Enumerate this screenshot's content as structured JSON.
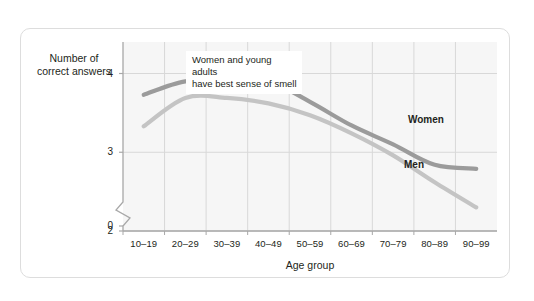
{
  "chart_data": {
    "type": "line",
    "title": "",
    "xlabel": "Age group",
    "ylabel": "Number of\ncorrect answers",
    "categories": [
      "10–19",
      "20–29",
      "30–39",
      "40–49",
      "50–59",
      "60–69",
      "70–79",
      "80–89",
      "90–99"
    ],
    "ylim": [
      2,
      4.4
    ],
    "yticks": [
      0,
      2,
      3,
      4
    ],
    "ytick_labels": [
      "0",
      "2",
      "3",
      "4"
    ],
    "y_axis_break": true,
    "grid": true,
    "legend_position": "inline",
    "series": [
      {
        "name": "Women",
        "color": "#9b9b9b",
        "values": [
          3.73,
          3.9,
          3.89,
          3.9,
          3.64,
          3.34,
          3.1,
          2.84,
          2.79
        ]
      },
      {
        "name": "Men",
        "color": "#c4c4c4",
        "values": [
          3.33,
          3.69,
          3.69,
          3.62,
          3.47,
          3.24,
          2.96,
          2.62,
          2.3
        ]
      }
    ],
    "annotations": [
      {
        "text": "Women and young adults\nhave best sense of smell",
        "x_category": "30–39",
        "y_value": 4.3
      }
    ]
  },
  "axis": {
    "y_title": "Number of\ncorrect answers",
    "x_title": "Age group"
  },
  "series_labels": {
    "women": "Women",
    "men": "Men"
  },
  "colors": {
    "women_line": "#9b9b9b",
    "men_line": "#c4c4c4",
    "plot_background": "#f6f6f6",
    "gridline": "#d8d8d8",
    "axis": "#a8a8a8",
    "card_border": "#dddddd",
    "text": "#231f20"
  }
}
